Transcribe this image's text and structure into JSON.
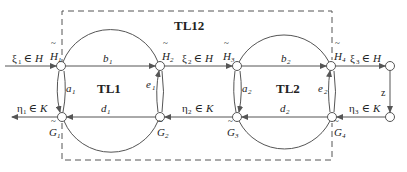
{
  "diagram": {
    "group_label": "TL12",
    "subsystems": [
      {
        "label": "TL1"
      },
      {
        "label": "TL2"
      }
    ],
    "nodes": {
      "H1": {
        "label": "H",
        "sub": "1"
      },
      "G1": {
        "label": "G",
        "sub": "1"
      },
      "H2": {
        "label": "H",
        "sub": "2"
      },
      "G2": {
        "label": "G",
        "sub": "2"
      },
      "H3": {
        "label": "H",
        "sub": "3"
      },
      "G3": {
        "label": "G",
        "sub": "3"
      },
      "H4": {
        "label": "H",
        "sub": "4"
      },
      "G4": {
        "label": "G",
        "sub": "4"
      }
    },
    "edges": {
      "b1": {
        "label": "b",
        "sub": "1"
      },
      "d1": {
        "label": "d",
        "sub": "1"
      },
      "a1": {
        "label": "a",
        "sub": "1"
      },
      "e1": {
        "label": "e",
        "sub": "1"
      },
      "b2": {
        "label": "b",
        "sub": "2"
      },
      "d2": {
        "label": "d",
        "sub": "2"
      },
      "a2": {
        "label": "a",
        "sub": "2"
      },
      "e2": {
        "label": "e",
        "sub": "2"
      },
      "z": {
        "label": "z"
      }
    },
    "signals": {
      "xi1": {
        "sym": "ξ",
        "sub": "1",
        "rest": " ∈ ",
        "set": "H"
      },
      "xi2": {
        "sym": "ξ",
        "sub": "2",
        "rest": " ∈ ",
        "set": "H"
      },
      "xi3": {
        "sym": "ξ",
        "sub": "3",
        "rest": " ∈ ",
        "set": "H"
      },
      "eta1": {
        "sym": "η",
        "sub": "1",
        "rest": " ∈ ",
        "set": "K"
      },
      "eta2": {
        "sym": "η",
        "sub": "2",
        "rest": " ∈ ",
        "set": "K"
      },
      "eta3": {
        "sym": "η",
        "sub": "3",
        "rest": " ∈ ",
        "set": "K"
      }
    },
    "tilde": "~"
  }
}
